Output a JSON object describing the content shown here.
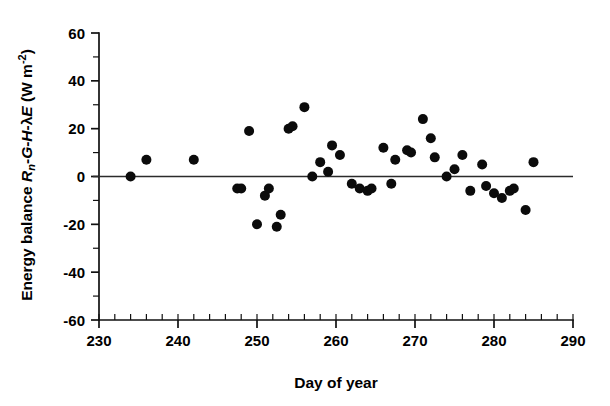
{
  "figure": {
    "background_color": "#ffffff",
    "ink_color": "#000000",
    "marker_color": "#0b0b0b"
  },
  "chart_data": {
    "type": "scatter",
    "title": "",
    "xlabel": "Day of year",
    "ylabel": "Energy balance Rₙ-G-H-λE (W m⁻²)",
    "ylabel_parts": {
      "prefix": "Energy balance ",
      "rn": "R",
      "rn_sub": "n",
      "dash1": "-",
      "g": "G",
      "dash2": "-",
      "h": "H",
      "dash3": "-",
      "lambda": "λ",
      "e": "E",
      "units": " (W m",
      "units_exp": "-2",
      "units_close": ")"
    },
    "xlim": [
      230,
      290
    ],
    "ylim": [
      -60,
      60
    ],
    "xticks": [
      230,
      240,
      250,
      260,
      270,
      280,
      290
    ],
    "xtick_labels": [
      "230",
      "240",
      "250",
      "260",
      "270",
      "280",
      "290"
    ],
    "yticks": [
      -60,
      -40,
      -20,
      0,
      20,
      40,
      60
    ],
    "ytick_labels": [
      "-60",
      "-40",
      "-20",
      "0",
      "20",
      "40",
      "60"
    ],
    "x_minor_step": 2,
    "y_minor_step": 10,
    "grid": false,
    "legend": null,
    "reference_line": {
      "type": "horizontal",
      "y": 0,
      "label": "zero energy balance line",
      "color": "#2b2b2b"
    },
    "marker": {
      "shape": "circle",
      "size_px": 5.0,
      "color": "#0b0b0b"
    },
    "n_points": 43,
    "x": [
      234,
      236,
      242,
      247.5,
      248,
      249,
      250,
      251,
      251.5,
      252.5,
      253,
      254,
      256,
      257,
      258,
      259,
      259.5,
      260.5,
      262,
      263,
      264,
      264.5,
      266,
      267,
      267.5,
      269,
      269.5,
      271,
      272,
      272.5,
      274,
      275,
      276,
      277,
      278.5,
      279,
      280,
      281,
      282,
      282.5,
      284,
      285,
      254.5
    ],
    "y": [
      0,
      7,
      7,
      -5,
      -5,
      19,
      -20,
      -8,
      -5,
      -21,
      -16,
      20,
      29,
      0,
      6,
      2,
      13,
      9,
      -3,
      -5,
      -6,
      -5,
      12,
      -3,
      7,
      11,
      10,
      24,
      16,
      8,
      0,
      3,
      9,
      -6,
      5,
      -4,
      -7,
      -9,
      -6,
      -5,
      -14,
      6,
      21
    ],
    "points": [
      {
        "x": 234,
        "y": 0
      },
      {
        "x": 236,
        "y": 7
      },
      {
        "x": 242,
        "y": 7
      },
      {
        "x": 247.5,
        "y": -5
      },
      {
        "x": 248,
        "y": -5
      },
      {
        "x": 249,
        "y": 19
      },
      {
        "x": 250,
        "y": -20
      },
      {
        "x": 251,
        "y": -8
      },
      {
        "x": 251.5,
        "y": -5
      },
      {
        "x": 252.5,
        "y": -21
      },
      {
        "x": 253,
        "y": -16
      },
      {
        "x": 254,
        "y": 20
      },
      {
        "x": 254.5,
        "y": 21
      },
      {
        "x": 256,
        "y": 29
      },
      {
        "x": 257,
        "y": 0
      },
      {
        "x": 258,
        "y": 6
      },
      {
        "x": 259,
        "y": 2
      },
      {
        "x": 259.5,
        "y": 13
      },
      {
        "x": 260.5,
        "y": 9
      },
      {
        "x": 262,
        "y": -3
      },
      {
        "x": 263,
        "y": -5
      },
      {
        "x": 264,
        "y": -6
      },
      {
        "x": 264.5,
        "y": -5
      },
      {
        "x": 266,
        "y": 12
      },
      {
        "x": 267,
        "y": -3
      },
      {
        "x": 267.5,
        "y": 7
      },
      {
        "x": 269,
        "y": 11
      },
      {
        "x": 269.5,
        "y": 10
      },
      {
        "x": 271,
        "y": 24
      },
      {
        "x": 272,
        "y": 16
      },
      {
        "x": 272.5,
        "y": 8
      },
      {
        "x": 274,
        "y": 0
      },
      {
        "x": 275,
        "y": 3
      },
      {
        "x": 276,
        "y": 9
      },
      {
        "x": 277,
        "y": -6
      },
      {
        "x": 278.5,
        "y": 5
      },
      {
        "x": 279,
        "y": -4
      },
      {
        "x": 280,
        "y": -7
      },
      {
        "x": 281,
        "y": -9
      },
      {
        "x": 282,
        "y": -6
      },
      {
        "x": 282.5,
        "y": -5
      },
      {
        "x": 284,
        "y": -14
      },
      {
        "x": 285,
        "y": 6
      }
    ]
  }
}
